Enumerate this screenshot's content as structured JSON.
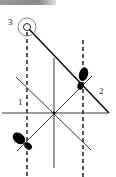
{
  "diagram": {
    "labels": {
      "one": "1",
      "two": "2",
      "three": "3"
    },
    "colors": {
      "line": "#111111",
      "footprint": "#000000",
      "circle": "#555555"
    },
    "elements": [
      "start-circle-3",
      "dashed-line-left",
      "dashed-line-right",
      "center-vertical-line",
      "horizontal-line",
      "diagonal-path-3-to-2",
      "diagonal-line-a",
      "diagonal-line-b",
      "footprint-right",
      "footprint-left"
    ]
  }
}
